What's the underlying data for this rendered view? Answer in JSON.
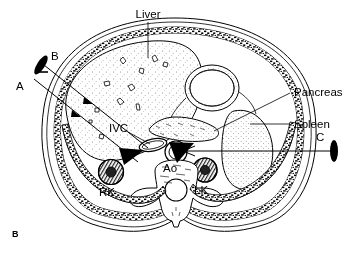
{
  "figure": {
    "id": "B",
    "type": "anatomical-cross-section"
  },
  "labels": {
    "liver": "Liver",
    "pancreas": "Pancreas",
    "spleen": "Spleen",
    "ivc": "IVC",
    "aorta": "Ao",
    "right_kidney": "RK",
    "left_kidney": "LK",
    "plane_a": "A",
    "plane_b": "B",
    "plane_c": "C"
  },
  "colors": {
    "ink": "#000000",
    "paper": "#ffffff",
    "stipple": "#555555"
  }
}
